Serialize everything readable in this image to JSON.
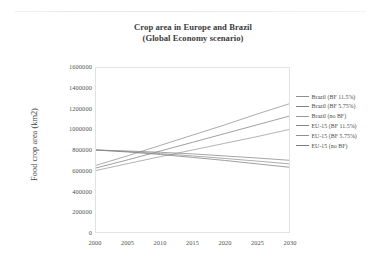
{
  "figure": {
    "title_line_1": "Crop area in Europe and Brazil",
    "title_line_2": "(Global Economy scenario)"
  },
  "chart_data": {
    "type": "line",
    "title": "Crop area in Europe and Brazil (Global Economy scenario)",
    "xlabel": "",
    "ylabel": "Food crop area (km2)",
    "xlim": [
      2000,
      2030
    ],
    "ylim": [
      0,
      1600000
    ],
    "grid": false,
    "legend_position": "right",
    "x": [
      2000,
      2005,
      2010,
      2015,
      2020,
      2025,
      2030
    ],
    "xtick_labels": [
      "2000",
      "2005",
      "2010",
      "2015",
      "2020",
      "2025",
      "2030"
    ],
    "ytick_labels": [
      "0",
      "200000",
      "400000",
      "600000",
      "800000",
      "1000000",
      "1200000",
      "1400000",
      "1600000"
    ],
    "ytick_values": [
      0,
      200000,
      400000,
      600000,
      800000,
      1000000,
      1200000,
      1400000,
      1600000
    ],
    "series": [
      {
        "name": "Brazil (BF 11.5%)",
        "color": "#8f8f8f",
        "values": [
          650000,
          745000,
          845000,
          945000,
          1045000,
          1150000,
          1250000
        ]
      },
      {
        "name": "Brazil (BF 5.75%)",
        "color": "#808080",
        "values": [
          625000,
          705000,
          790000,
          875000,
          960000,
          1045000,
          1130000
        ]
      },
      {
        "name": "Brazil (no BF)",
        "color": "#9a9a9a",
        "values": [
          600000,
          668000,
          735000,
          800000,
          865000,
          930000,
          1000000
        ]
      },
      {
        "name": "EU-15 (BF 11.5%)",
        "color": "#878787",
        "values": [
          800000,
          790000,
          778000,
          762000,
          742000,
          722000,
          700000
        ]
      },
      {
        "name": "EU-15 (BF 5.75%)",
        "color": "#919191",
        "values": [
          800000,
          785000,
          765000,
          742000,
          718000,
          692000,
          665000
        ]
      },
      {
        "name": "EU-15 (no BF)",
        "color": "#7d7d7d",
        "values": [
          800000,
          780000,
          756000,
          728000,
          698000,
          665000,
          632000
        ]
      }
    ]
  },
  "legend": {
    "items": [
      {
        "label": "Brazil (BF 11.5%)"
      },
      {
        "label": "Brazil (BF 5.75%)"
      },
      {
        "label": "Brazil (no BF)"
      },
      {
        "label": "EU-15 (BF 11.5%)"
      },
      {
        "label": "EU-15 (BF 5.75%)"
      },
      {
        "label": "EU-15 (no BF)"
      }
    ]
  }
}
